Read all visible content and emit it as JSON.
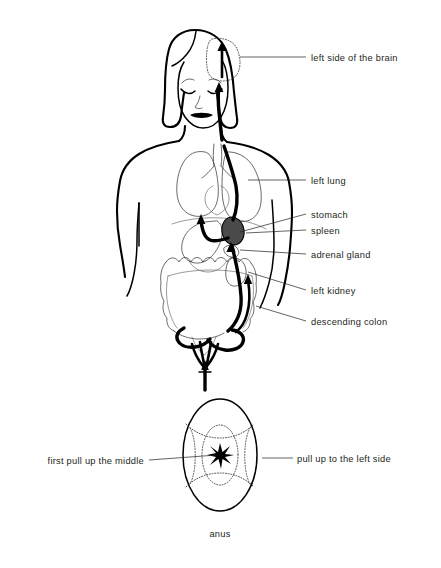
{
  "figure": {
    "caption": "anus",
    "labels": [
      {
        "id": "brain",
        "text": "left side of the brain",
        "side": "right"
      },
      {
        "id": "left-lung",
        "text": "left lung",
        "side": "right"
      },
      {
        "id": "stomach",
        "text": "stomach",
        "side": "right"
      },
      {
        "id": "spleen",
        "text": "spleen",
        "side": "right"
      },
      {
        "id": "adrenal-gland",
        "text": "adrenal gland",
        "side": "right"
      },
      {
        "id": "left-kidney",
        "text": "left kidney",
        "side": "right"
      },
      {
        "id": "descending-colon",
        "text": "descending colon",
        "side": "right"
      },
      {
        "id": "pull-middle",
        "text": "first pull up the middle",
        "side": "left"
      },
      {
        "id": "pull-left-side",
        "text": "pull up to the left side",
        "side": "right"
      }
    ],
    "colors": {
      "ink": "#231f20",
      "outline": "#000000",
      "organ": "#3a3a3a",
      "spleen_fill": "#4a4a4a",
      "background": "#ffffff"
    }
  }
}
